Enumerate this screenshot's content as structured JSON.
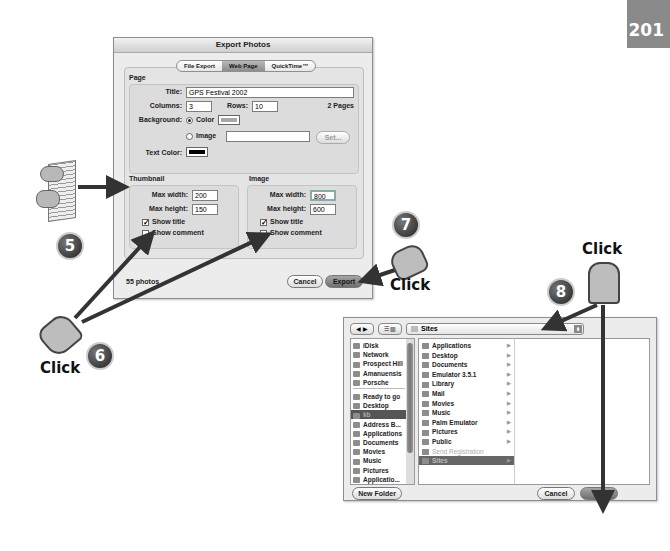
{
  "page_number": "201",
  "export_dialog": {
    "title": "Export Photos",
    "tabs": [
      {
        "label": "File Export",
        "selected": false
      },
      {
        "label": "Web Page",
        "selected": true
      },
      {
        "label": "QuickTime™",
        "selected": false
      }
    ],
    "page_section": {
      "heading": "Page",
      "title_label": "Title:",
      "title_value": "GPS Festival 2002",
      "columns_label": "Columns:",
      "columns_value": "3",
      "rows_label": "Rows:",
      "rows_value": "10",
      "pages_text": "2 Pages",
      "background_label": "Background:",
      "bg_color_label": "Color",
      "bg_image_label": "Image",
      "bg_selected": "Color",
      "set_button": "Set...",
      "text_color_label": "Text Color:"
    },
    "thumbnail": {
      "heading": "Thumbnail",
      "max_width_label": "Max width:",
      "max_width": "200",
      "max_height_label": "Max height:",
      "max_height": "150",
      "show_title_label": "Show title",
      "show_title": true,
      "show_comment_label": "Show comment",
      "show_comment": false
    },
    "image": {
      "heading": "Image",
      "max_width_label": "Max width:",
      "max_width": "800",
      "max_height_label": "Max height:",
      "max_height": "600",
      "show_title_label": "Show title",
      "show_title": true,
      "show_comment_label": "Show comment",
      "show_comment": false
    },
    "photo_count": "55 photos",
    "cancel_button": "Cancel",
    "export_button": "Export"
  },
  "file_chooser": {
    "location": "Sites",
    "sidebar": [
      {
        "label": "iDisk"
      },
      {
        "label": "Network"
      },
      {
        "label": "Prospect Hill"
      },
      {
        "label": "Amanuensis"
      },
      {
        "label": "Porsche"
      },
      {
        "label": "Ready to go"
      },
      {
        "label": "Desktop"
      },
      {
        "label": "kb",
        "selected": true
      },
      {
        "label": "Address B..."
      },
      {
        "label": "Applications"
      },
      {
        "label": "Documents"
      },
      {
        "label": "Movies"
      },
      {
        "label": "Music"
      },
      {
        "label": "Pictures"
      },
      {
        "label": "Applicatio..."
      }
    ],
    "column": [
      {
        "label": "Applications"
      },
      {
        "label": "Desktop"
      },
      {
        "label": "Documents"
      },
      {
        "label": "Emulator 3.5.1"
      },
      {
        "label": "Library"
      },
      {
        "label": "Mail"
      },
      {
        "label": "Movies"
      },
      {
        "label": "Music"
      },
      {
        "label": "Palm Emulator"
      },
      {
        "label": "Pictures"
      },
      {
        "label": "Public"
      },
      {
        "label": "Send Registration",
        "dimmed": true
      },
      {
        "label": "Sites",
        "selected": true
      }
    ],
    "new_folder_button": "New Folder",
    "cancel_button": "Cancel",
    "ok_button": "OK"
  },
  "callouts": {
    "step5": "5",
    "step6": "6",
    "step7": "7",
    "step8": "8",
    "click_label": "Click"
  }
}
